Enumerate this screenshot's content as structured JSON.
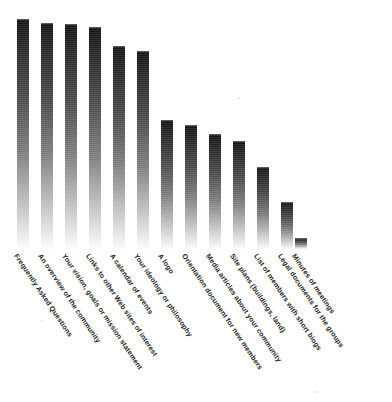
{
  "chart_data": {
    "type": "bar",
    "title": "",
    "subtitle": "",
    "xlabel": "",
    "ylabel": "",
    "grid": false,
    "legend": null,
    "legend_position": "none",
    "axis_visible": false,
    "value_labels_shown": false,
    "ylim": [
      0,
      100
    ],
    "orientation": "vertical",
    "bar_style": {
      "gradient": "vertical, dark at top to white at baseline",
      "color_top": "#131313",
      "color_bottom": "#fbfbfb",
      "bar_width_px": 12,
      "bar_pitch_px": 24,
      "baseline_y_px": 249
    },
    "label_rotation_deg": 56,
    "categories": [
      "Frequently Asked Questions",
      "An overview of the community",
      "Your vision, goals or mission statement",
      "Links to other Web sites of interest",
      "A calendar of events",
      "Your ideology or philosophy",
      "A logo",
      "Orientation document for new members",
      "Media articles about your community",
      "Site plans (buildings, land)",
      "List of members with short biogs",
      "Legal documents for the groups",
      "Minutes of meetings"
    ],
    "values": [
      100,
      98,
      98,
      97,
      88,
      86,
      56,
      54,
      50,
      47,
      36,
      20,
      5
    ],
    "pixel_heights": [
      230,
      226,
      225,
      222,
      203,
      198,
      129,
      124,
      115,
      108,
      82,
      47,
      11
    ],
    "bar_left_px": [
      17,
      41,
      65,
      89,
      113,
      137,
      161,
      185,
      209,
      233,
      257,
      281,
      295
    ]
  },
  "labels": {
    "items": [
      "Frequently Asked Questions",
      "An overview of the community",
      "Your vision, goals or mission statement",
      "Links to other Web sites of interest",
      "A calendar of events",
      "Your ideology or philosophy",
      "A logo",
      "Orientation document for new members",
      "Media articles about your community",
      "Site plans (buildings, land)",
      "List of members with short biogs",
      "Legal documents for the groups",
      "Minutes of meetings"
    ]
  }
}
